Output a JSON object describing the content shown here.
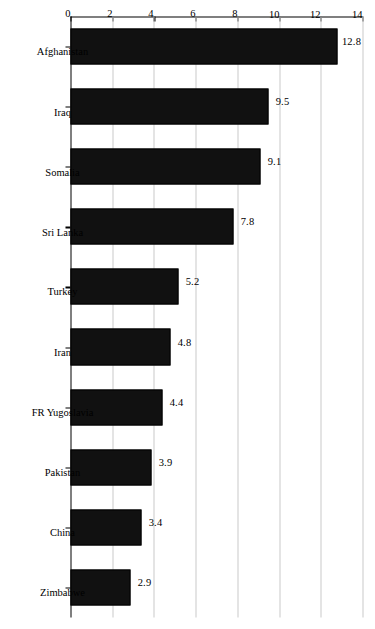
{
  "chart_data": {
    "type": "bar",
    "orientation": "vertical-rotated-90",
    "title": "",
    "subtitle": "",
    "xlabel": "",
    "ylabel": "",
    "ylim": [
      0,
      14
    ],
    "grid": true,
    "legend": "none",
    "categories": [
      "Afghanistan",
      "Iraq",
      "Somalia",
      "Sri Lanka",
      "Turkey",
      "Iran",
      "FR Yugoslavia",
      "Pakistan",
      "China",
      "Zimbabwe"
    ],
    "values": [
      12.8,
      9.5,
      9.1,
      7.8,
      5.2,
      4.8,
      4.4,
      3.9,
      3.4,
      2.9
    ],
    "data_labels": [
      "12.8",
      "9.5",
      "9.1",
      "7.8",
      "5.2",
      "4.8",
      "4.4",
      "3.9",
      "3.4",
      "2.9"
    ],
    "y_ticks": [
      0,
      2,
      4,
      6,
      8,
      10,
      12,
      14
    ],
    "y_tick_labels": [
      "0",
      "2",
      "4",
      "6",
      "8",
      "10",
      "12",
      "14"
    ],
    "bar_color": "#111111",
    "grid_color": "#c9c9c9",
    "axis_color": "#000000",
    "background_color": "#ffffff"
  }
}
